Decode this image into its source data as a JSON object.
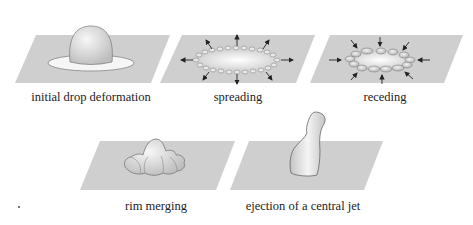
{
  "figure": {
    "panels": [
      {
        "id": "initial",
        "caption": "initial drop deformation"
      },
      {
        "id": "spreading",
        "caption": "spreading"
      },
      {
        "id": "receding",
        "caption": "receding"
      },
      {
        "id": "rim-merging",
        "caption": "rim merging"
      },
      {
        "id": "jet",
        "caption": "ejection of a central jet"
      }
    ],
    "colors": {
      "plane": "#cfcfcf",
      "drop_light": "#f4f4f4",
      "drop_dark": "#b9b9b9",
      "outline": "#6a6a6a",
      "arrow": "#222222"
    }
  }
}
